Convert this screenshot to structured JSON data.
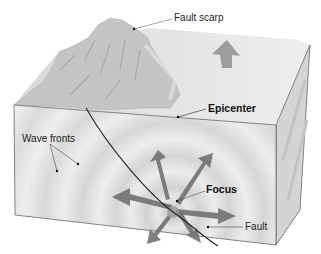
{
  "diagram": {
    "type": "earthquake block diagram",
    "labels": {
      "fault_scarp": "Fault scarp",
      "epicenter": "Epicenter",
      "wave_fronts": "Wave fronts",
      "focus": "Focus",
      "fault": "Fault"
    },
    "colors": {
      "front_face": "#e6e6e6",
      "side_face": "#d4d4d4",
      "top_face": "#ebebeb",
      "wave_band": "#d6d6d6",
      "arrow": "#6e6e6e",
      "fault_line": "#222222",
      "mountain": "#bdbdbd"
    }
  }
}
